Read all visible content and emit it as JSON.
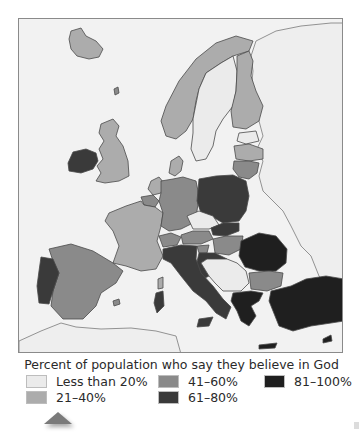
{
  "map": {
    "title": "Europe: belief in God",
    "colors": {
      "sea": "#f2f2f2",
      "border": "#4a4a4a",
      "lt20": "#ebebeb",
      "p21_40": "#acacac",
      "p41_60": "#8a8a8a",
      "p61_80": "#3a3a3a",
      "p81_100": "#1f1f1f",
      "no_data": "#eeeeee"
    },
    "countries": [
      {
        "name": "Iceland",
        "category": "21-40%"
      },
      {
        "name": "Ireland",
        "category": "61-80%"
      },
      {
        "name": "United Kingdom",
        "category": "21-40%"
      },
      {
        "name": "Norway",
        "category": "21-40%"
      },
      {
        "name": "Sweden",
        "category": "Less than 20%"
      },
      {
        "name": "Finland",
        "category": "21-40%"
      },
      {
        "name": "Denmark",
        "category": "21-40%"
      },
      {
        "name": "Estonia",
        "category": "Less than 20%"
      },
      {
        "name": "Latvia",
        "category": "21-40%"
      },
      {
        "name": "Lithuania",
        "category": "41-60%"
      },
      {
        "name": "Netherlands",
        "category": "21-40%"
      },
      {
        "name": "Belgium",
        "category": "41-60%"
      },
      {
        "name": "France",
        "category": "21-40%"
      },
      {
        "name": "Germany",
        "category": "41-60%"
      },
      {
        "name": "Poland",
        "category": "61-80%"
      },
      {
        "name": "Czech Republic",
        "category": "Less than 20%"
      },
      {
        "name": "Slovakia",
        "category": "61-80%"
      },
      {
        "name": "Austria",
        "category": "41-60%"
      },
      {
        "name": "Switzerland",
        "category": "41-60%"
      },
      {
        "name": "Hungary",
        "category": "41-60%"
      },
      {
        "name": "Slovenia",
        "category": "41-60%"
      },
      {
        "name": "Croatia",
        "category": "61-80%"
      },
      {
        "name": "Italy",
        "category": "61-80%"
      },
      {
        "name": "Spain",
        "category": "41-60%"
      },
      {
        "name": "Portugal",
        "category": "61-80%"
      },
      {
        "name": "Romania",
        "category": "81-100%"
      },
      {
        "name": "Bulgaria",
        "category": "41-60%"
      },
      {
        "name": "Greece",
        "category": "81-100%"
      },
      {
        "name": "Turkey",
        "category": "81-100%"
      },
      {
        "name": "Cyprus",
        "category": "81-100%"
      },
      {
        "name": "Malta",
        "category": "81-100%"
      }
    ]
  },
  "legend": {
    "title": "Percent of population who say they believe in God",
    "items": [
      {
        "label": "Less than 20%",
        "color": "#ebebeb"
      },
      {
        "label": "21–40%",
        "color": "#acacac"
      },
      {
        "label": "41–60%",
        "color": "#8a8a8a"
      },
      {
        "label": "61–80%",
        "color": "#3a3a3a"
      },
      {
        "label": "81–100%",
        "color": "#1f1f1f"
      }
    ]
  }
}
